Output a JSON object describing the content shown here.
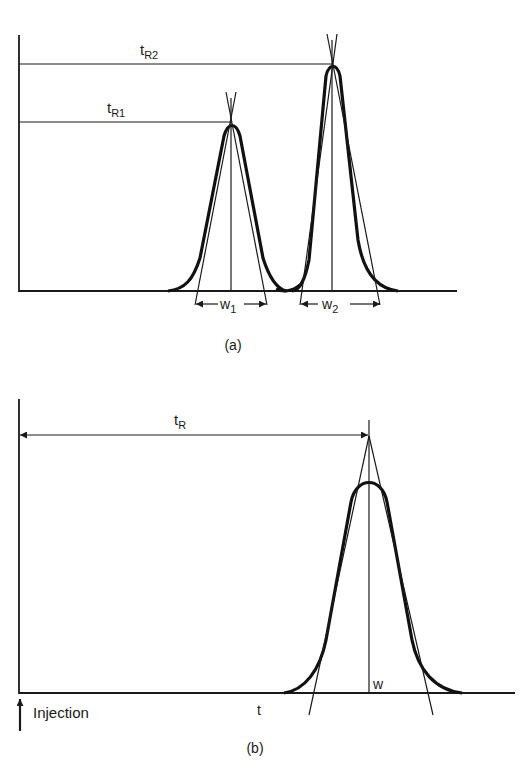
{
  "figure": {
    "panel_a": {
      "caption": "(a)",
      "labels": {
        "tR1_base": "t",
        "tR1_sub": "R1",
        "tR2_base": "t",
        "tR2_sub": "R2",
        "w1_base": "w",
        "w1_sub": "1",
        "w2_base": "w",
        "w2_sub": "2"
      }
    },
    "panel_b": {
      "caption": "(b)",
      "labels": {
        "tR_base": "t",
        "tR_sub": "R",
        "w": "w",
        "t_axis": "t",
        "injection": "Injection"
      }
    },
    "colors": {
      "ink": "#1a1a1a",
      "background": "#ffffff"
    }
  }
}
